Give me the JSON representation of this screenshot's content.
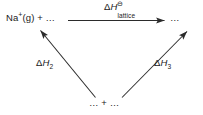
{
  "diagram": {
    "type": "born-haber-energy-cycle",
    "background_color": "#ffffff",
    "stroke_color": "#2b2b2b",
    "text_color": "#1a1a1a",
    "nodes": {
      "left_species": {
        "text_prefix": "Na",
        "charge": "+",
        "text_suffix": "(g) + …",
        "full_text": "Na⁺(g) + …"
      },
      "right_species": {
        "full_text": "…"
      },
      "bottom_species": {
        "full_text": "… + …"
      }
    },
    "arrows": {
      "lattice": {
        "label_delta": "Δ",
        "label_h": "H",
        "label_standard_symbol": "⊖",
        "label_subscript": "lattice",
        "full_label": "ΔH⊖lattice",
        "direction": "left-to-right-horizontal"
      },
      "dh2": {
        "label_delta": "Δ",
        "label_h": "H",
        "label_subscript": "2",
        "full_label": "ΔH₂",
        "direction": "bottom-right-to-top-left"
      },
      "dh3": {
        "label_delta": "Δ",
        "label_h": "H",
        "label_subscript": "3",
        "full_label": "ΔH₃",
        "direction": "bottom-left-to-top-right"
      }
    }
  }
}
